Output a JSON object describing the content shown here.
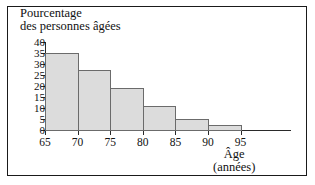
{
  "chart_data": {
    "type": "bar",
    "title": "Pourcentage des personnes âgées",
    "title_lines": [
      "Pourcentage",
      "des personnes âgées"
    ],
    "xlabel": "Âge",
    "xlabel_unit": "(années)",
    "ylabel": "Pourcentage des personnes âgées",
    "bin_edges": [
      65,
      70,
      75,
      80,
      85,
      90,
      95
    ],
    "categories": [
      "65-70",
      "70-75",
      "75-80",
      "80-85",
      "85-90",
      "90-95"
    ],
    "values": [
      35,
      27.5,
      19,
      11,
      5,
      2.5
    ],
    "xlim": [
      65,
      97.5
    ],
    "ylim": [
      0,
      40
    ],
    "xticks": [
      65,
      70,
      75,
      80,
      85,
      90,
      95
    ],
    "yticks": [
      0,
      5,
      10,
      15,
      20,
      25,
      30,
      35,
      40
    ],
    "xtick_labels": [
      "65",
      "70",
      "75",
      "80",
      "85",
      "90",
      "95"
    ],
    "ytick_labels": [
      "0",
      "5",
      "10",
      "15",
      "20",
      "25",
      "30",
      "35",
      "40"
    ],
    "grid": false,
    "legend": false,
    "bar_fill_color": "#dcdcdc",
    "bar_edge_color": "#6b6b6b",
    "axis_color": "#2a2a2a",
    "frame_color": "#1a1a1a",
    "background_color": "#ffffff"
  }
}
